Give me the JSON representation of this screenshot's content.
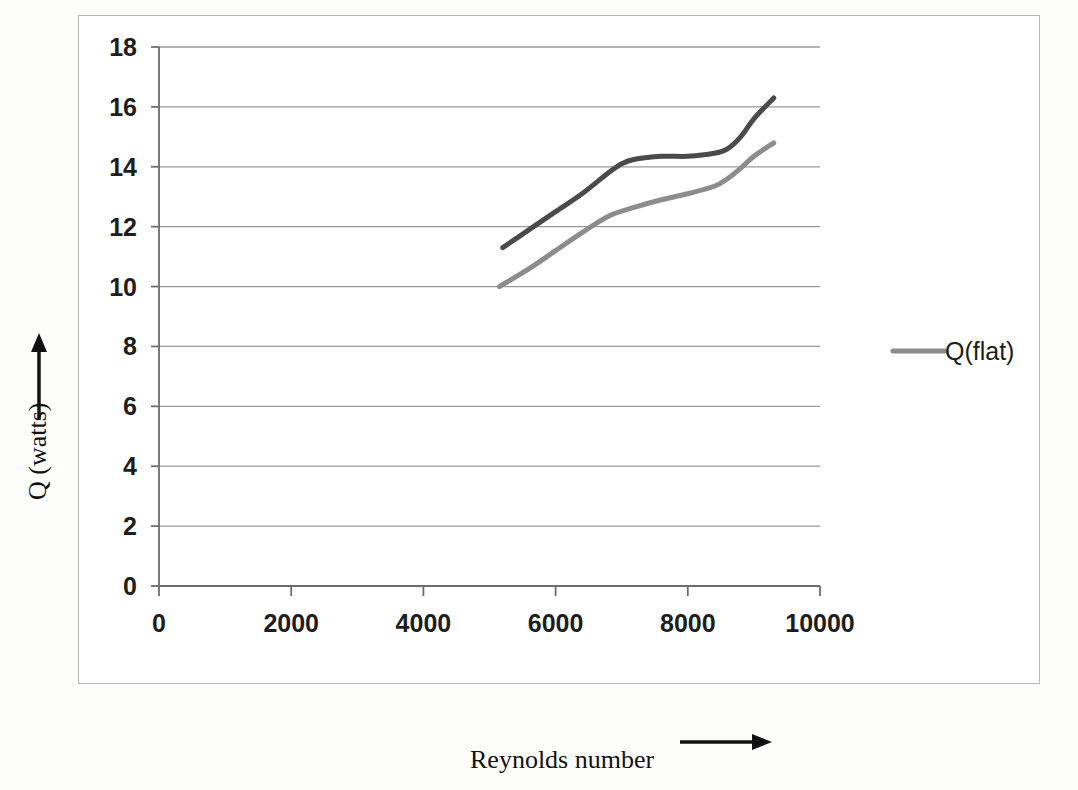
{
  "chart_data": {
    "type": "line",
    "title": "",
    "xlabel": "Reynolds number",
    "ylabel": "Q (watts)",
    "xlim": [
      0,
      10000
    ],
    "ylim": [
      0,
      18
    ],
    "xticks": [
      "0",
      "2000",
      "4000",
      "6000",
      "8000",
      "10000"
    ],
    "xtick_values": [
      0,
      2000,
      4000,
      6000,
      8000,
      10000
    ],
    "yticks": [
      "0",
      "2",
      "4",
      "6",
      "8",
      "10",
      "12",
      "14",
      "16",
      "18"
    ],
    "ytick_values": [
      0,
      2,
      4,
      6,
      8,
      10,
      12,
      14,
      16,
      18
    ],
    "grid": "horizontal",
    "legend_position": "right",
    "legend_entries": [
      "Q(flat)"
    ],
    "series": [
      {
        "name": "Q(upper)",
        "color": "#4a4a4a",
        "linewidth": 5,
        "x": [
          5200,
          5600,
          6000,
          6400,
          6800,
          7000,
          7200,
          7600,
          8000,
          8400,
          8600,
          8800,
          9000,
          9300
        ],
        "y": [
          11.3,
          11.9,
          12.5,
          13.1,
          13.8,
          14.1,
          14.25,
          14.35,
          14.35,
          14.45,
          14.6,
          15.0,
          15.6,
          16.3
        ]
      },
      {
        "name": "Q(flat)",
        "color": "#8c8c8c",
        "linewidth": 5,
        "x": [
          5150,
          5600,
          6000,
          6400,
          6800,
          7200,
          7600,
          8000,
          8400,
          8600,
          8800,
          9000,
          9300
        ],
        "y": [
          10.0,
          10.6,
          11.2,
          11.8,
          12.35,
          12.65,
          12.9,
          13.1,
          13.35,
          13.6,
          13.95,
          14.35,
          14.8
        ]
      }
    ]
  },
  "axis_labels": {
    "x_label_text": "Reynolds number",
    "x_arrow": "right-arrow",
    "y_label_text": "Q (watts)",
    "y_arrow": "up-arrow"
  },
  "legend": {
    "items": [
      {
        "label": "Q(flat)",
        "swatch_color": "#8c8c8c"
      }
    ]
  },
  "colors": {
    "series_upper": "#4a4a4a",
    "series_flat": "#8c8c8c",
    "gridline": "#9a9a9a",
    "axis": "#6d6d6d",
    "frame": "#b9b9b9",
    "text": "#1d1d1d",
    "background": "#ffffff"
  }
}
